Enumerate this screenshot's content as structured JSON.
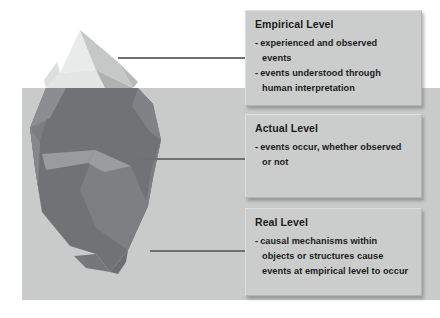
{
  "diagram": {
    "title_semantic": "critical-realism-iceberg-three-levels",
    "illustration": {
      "name": "iceberg",
      "above_water_label": "iceberg-tip",
      "below_water_label": "iceberg-submerged-mass",
      "waterline_label": "water-surface"
    },
    "colors": {
      "water": "#c9cbcb",
      "box_fill": "#cbcdcd",
      "box_border": "#b4b6b6",
      "connector": "#6e7072",
      "ice_light": "#e9eaea",
      "ice_mid": "#d2d4d4",
      "ice_shadow": "#bcbebe",
      "submerged_dark": "#6f7375",
      "submerged_mid": "#7e8284",
      "submerged_light": "#8d9193",
      "text": "#1b1b1b"
    },
    "levels": [
      {
        "id": "empirical",
        "title": "Empirical Level",
        "bullets": [
          {
            "dash": "-",
            "lines": [
              "experienced and observed",
              "events"
            ]
          },
          {
            "dash": "-",
            "lines": [
              "events understood through",
              "human interpretation"
            ]
          }
        ]
      },
      {
        "id": "actual",
        "title": "Actual Level",
        "bullets": [
          {
            "dash": "-",
            "lines": [
              "events occur, whether observed",
              "or not"
            ]
          }
        ]
      },
      {
        "id": "real",
        "title": "Real Level",
        "bullets": [
          {
            "dash": "-",
            "lines": [
              "causal mechanisms within",
              "objects or structures cause",
              "events at empirical level to occur"
            ]
          }
        ]
      }
    ],
    "connectors": [
      {
        "id": "connector-empirical",
        "from": "iceberg-tip",
        "to": "empirical"
      },
      {
        "id": "connector-actual",
        "from": "iceberg-waterline",
        "to": "actual"
      },
      {
        "id": "connector-real",
        "from": "iceberg-submerged-mass",
        "to": "real"
      }
    ]
  }
}
